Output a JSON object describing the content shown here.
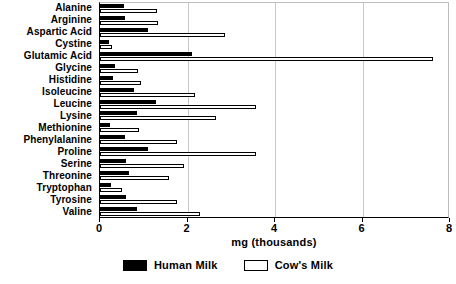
{
  "chart_data": {
    "type": "bar",
    "orientation": "horizontal",
    "title": "",
    "xlabel": "mg (thousands)",
    "ylabel": "",
    "xlim": [
      0,
      8
    ],
    "xticks": [
      0,
      2,
      4,
      6,
      8
    ],
    "xtick_labels": [
      "0",
      "2",
      "4",
      "6",
      "8"
    ],
    "grid": true,
    "grid_axis": "x",
    "legend_position": "bottom-center",
    "categories": [
      "Alanine",
      "Arginine",
      "Aspartic Acid",
      "Cystine",
      "Glutamic Acid",
      "Glycine",
      "Histidine",
      "Isoleucine",
      "Leucine",
      "Lysine",
      "Methionine",
      "Phenylalanine",
      "Proline",
      "Serine",
      "Threonine",
      "Tryptophan",
      "Tyrosine",
      "Valine"
    ],
    "series": [
      {
        "name": "Human Milk",
        "color": "#000000",
        "values": [
          0.55,
          0.58,
          1.1,
          0.2,
          2.1,
          0.35,
          0.3,
          0.77,
          1.27,
          0.85,
          0.23,
          0.56,
          1.1,
          0.59,
          0.66,
          0.24,
          0.59,
          0.85
        ]
      },
      {
        "name": "Cow's Milk",
        "color": "#ffffff",
        "values": [
          1.3,
          1.32,
          2.85,
          0.28,
          7.6,
          0.87,
          0.93,
          2.16,
          3.56,
          2.64,
          0.9,
          1.77,
          3.57,
          1.93,
          1.58,
          0.5,
          1.77,
          2.28
        ]
      }
    ]
  },
  "axis": {
    "x_title": "mg (thousands)"
  },
  "legend": {
    "items": [
      {
        "label": "Human Milk",
        "swatch": "filled-black-swatch"
      },
      {
        "label": "Cow's Milk",
        "swatch": "outlined-white-swatch"
      }
    ]
  }
}
